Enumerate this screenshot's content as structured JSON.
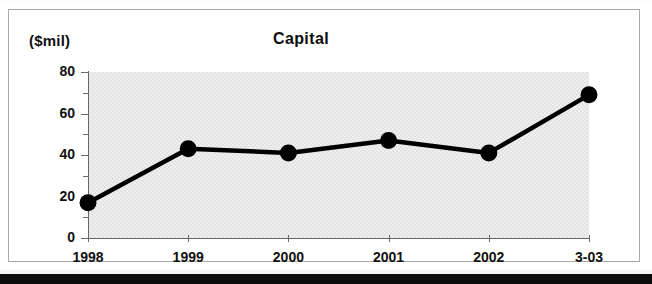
{
  "figure": {
    "unit_label": "($mil)",
    "title": "Capital"
  },
  "chart_data": {
    "type": "line",
    "title": "Capital",
    "xlabel": "",
    "ylabel": "($mil)",
    "categories": [
      "1998",
      "1999",
      "2000",
      "2001",
      "2002",
      "3-03"
    ],
    "values": [
      17,
      43,
      41,
      47,
      41,
      69
    ],
    "ylim": [
      0,
      80
    ],
    "y_major_ticks": [
      0,
      20,
      40,
      60,
      80
    ],
    "y_minor_ticks": [
      10,
      30,
      50,
      70
    ],
    "y_tick_labels": [
      "0",
      "20",
      "40",
      "60",
      "80"
    ],
    "grid": false,
    "legend": "none",
    "series": [
      {
        "name": "Capital",
        "values": [
          17,
          43,
          41,
          47,
          41,
          69
        ],
        "line_color": "#000000",
        "marker": "circle",
        "marker_color": "#000000"
      }
    ],
    "plot_background": "#e3e3e3",
    "axis_color": "#666666"
  }
}
